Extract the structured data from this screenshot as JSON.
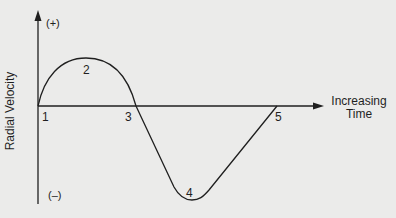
{
  "diagram": {
    "y_axis": {
      "label": "Radial Velocity",
      "positive_label": "(+)",
      "negative_label": "(–)"
    },
    "x_axis": {
      "label_line1": "Increasing",
      "label_line2": "Time"
    },
    "points": [
      {
        "id": "1",
        "label": "1"
      },
      {
        "id": "2",
        "label": "2"
      },
      {
        "id": "3",
        "label": "3"
      },
      {
        "id": "4",
        "label": "4"
      },
      {
        "id": "5",
        "label": "5"
      }
    ],
    "colors": {
      "background": "#ebebea",
      "line": "#1f1f1f"
    }
  }
}
